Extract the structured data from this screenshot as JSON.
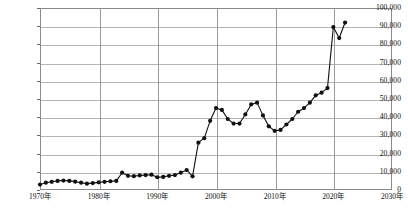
{
  "chart_data": {
    "type": "line",
    "title": "",
    "xlabel": "",
    "ylabel": "",
    "xlim": [
      1970,
      2030
    ],
    "ylim": [
      0,
      100000
    ],
    "grid": true,
    "legend": null,
    "marker": "filled-circle",
    "y_ticks": [
      0,
      10000,
      20000,
      30000,
      40000,
      50000,
      60000,
      70000,
      80000,
      90000,
      100000
    ],
    "y_tick_labels": [
      "0",
      "10,000",
      "20,000",
      "30,000",
      "40,000",
      "50,000",
      "60,000",
      "70,000",
      "80,000",
      "90,000",
      "100,000"
    ],
    "x_ticks": [
      1970,
      1980,
      1990,
      2000,
      2010,
      2020,
      2030
    ],
    "x_tick_labels": [
      "1970年",
      "1980年",
      "1990年",
      "2000年",
      "2010年",
      "2020年",
      "2030年"
    ],
    "line_color": "#111111",
    "grid_color": "#b4b4b4",
    "frame_color": "#8a8a8a",
    "x": [
      1970,
      1971,
      1972,
      1973,
      1974,
      1975,
      1976,
      1977,
      1978,
      1979,
      1980,
      1981,
      1982,
      1983,
      1984,
      1985,
      1986,
      1987,
      1988,
      1989,
      1990,
      1991,
      1992,
      1993,
      1994,
      1995,
      1996,
      1997,
      1998,
      1999,
      2000,
      2001,
      2002,
      2003,
      2004,
      2005,
      2006,
      2007,
      2008,
      2009,
      2010,
      2011,
      2012,
      2013,
      2014,
      2015,
      2016,
      2017,
      2018,
      2019,
      2020,
      2021,
      2022
    ],
    "values": [
      3000,
      4000,
      4500,
      5000,
      5200,
      5000,
      4600,
      4000,
      3500,
      3800,
      4200,
      4500,
      4800,
      5000,
      9500,
      7800,
      7600,
      8000,
      8200,
      8400,
      7000,
      7200,
      7800,
      8200,
      9500,
      11000,
      7500,
      26000,
      28500,
      38000,
      45000,
      44000,
      39000,
      36500,
      36500,
      41500,
      47000,
      48000,
      41000,
      35000,
      32500,
      33000,
      36000,
      39000,
      43000,
      45000,
      48000,
      52000,
      53500,
      56000,
      89500,
      83500,
      92000
    ]
  }
}
